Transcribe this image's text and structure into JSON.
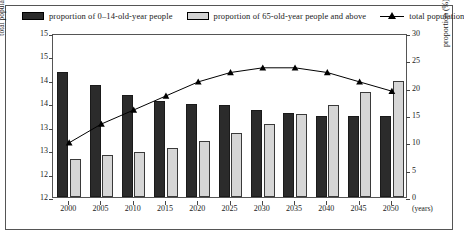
{
  "legend": {
    "items": [
      {
        "label": "proportion of 0–14-old-year people",
        "swatch": "dark-square-swatch",
        "color": "#2b2b2b"
      },
      {
        "label": "proportion of 65-old-year people and above",
        "swatch": "light-square-swatch",
        "color": "#d4d4d4"
      },
      {
        "label": "total population",
        "swatch": "line-triangle-marker",
        "color": "#000000"
      }
    ]
  },
  "axes": {
    "left_title": "total population (a hundred million people)",
    "right_title": "proportion (%)",
    "x_units": "(years)",
    "left_ticks": [
      "15",
      "15",
      "14",
      "14",
      "13",
      "13",
      "12",
      "12"
    ],
    "left_values": [
      15.0,
      14.5,
      14.0,
      13.5,
      13.0,
      12.5,
      12.0,
      11.5
    ],
    "right_ticks": [
      "30",
      "25",
      "20",
      "15",
      "10",
      "5",
      "0"
    ],
    "right_values": [
      30,
      25,
      20,
      15,
      10,
      5,
      0
    ]
  },
  "chart_data": {
    "type": "bar",
    "title": "",
    "xlabel": "(years)",
    "ylabel": "total population (a hundred million people)",
    "y2label": "proportion (%)",
    "categories": [
      "2000",
      "2005",
      "2010",
      "2015",
      "2020",
      "2025",
      "2030",
      "2035",
      "2040",
      "2045",
      "2050"
    ],
    "ylim": [
      11.5,
      15.0
    ],
    "y2lim": [
      0,
      30
    ],
    "grid": false,
    "legend_position": "top",
    "series": [
      {
        "name": "proportion of 0–14-old-year people",
        "type": "bar",
        "axis": "right",
        "color": "#2b2b2b",
        "values": [
          22.9,
          20.4,
          18.6,
          17.5,
          17.0,
          16.8,
          15.9,
          15.3,
          14.9,
          14.9,
          14.9
        ]
      },
      {
        "name": "proportion of 65-old-year people and above",
        "type": "bar",
        "axis": "right",
        "color": "#d6d6d6",
        "values": [
          6.9,
          7.6,
          8.3,
          9.0,
          10.2,
          11.8,
          13.4,
          15.1,
          16.8,
          19.2,
          21.3
        ]
      },
      {
        "name": "total population",
        "type": "line",
        "axis": "left",
        "color": "#000000",
        "marker": "triangle",
        "values": [
          12.7,
          13.1,
          13.4,
          13.7,
          14.0,
          14.2,
          14.3,
          14.3,
          14.2,
          14.0,
          13.8
        ]
      }
    ]
  }
}
